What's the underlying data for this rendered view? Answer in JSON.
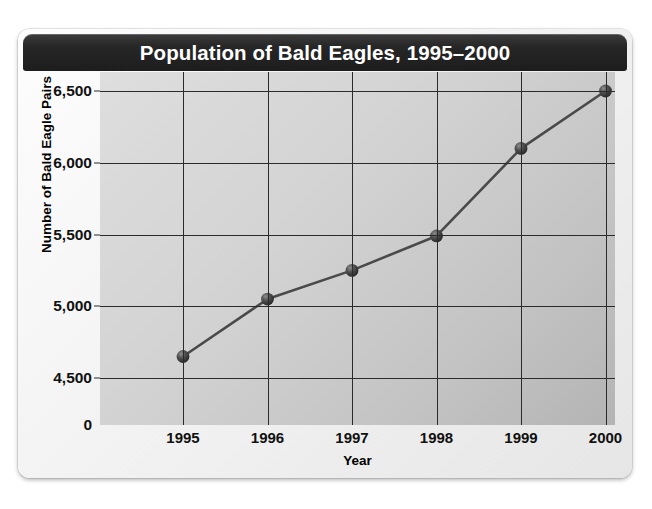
{
  "chart_data": {
    "type": "line",
    "title": "Population of Bald Eagles, 1995–2000",
    "xlabel": "Year",
    "ylabel": "Number of Bald Eagle Pairs",
    "categories": [
      "1995",
      "1996",
      "1997",
      "1998",
      "1999",
      "2000"
    ],
    "values": [
      4650,
      5050,
      5250,
      5490,
      6100,
      6500
    ],
    "y_tick_labels": [
      "6,500",
      "6,000",
      "5,500",
      "5,000",
      "4,500",
      "0"
    ],
    "y_tick_values": [
      6500,
      6000,
      5500,
      5000,
      4500,
      0
    ],
    "ylim": [
      4300,
      6600
    ],
    "axis_break": true,
    "grid": true,
    "legend": "none",
    "series": [
      {
        "name": "Bald eagle pairs",
        "values": [
          4650,
          5050,
          5250,
          5490,
          6100,
          6500
        ]
      }
    ],
    "colors": {
      "title_bar": "#242424",
      "title_text": "#ffffff",
      "plot_background_light": "#dedede",
      "plot_background_dark": "#b4b4b4",
      "grid_line": "#2b2b2b",
      "series_line": "#4a4a4a",
      "marker": "#3a3a3a",
      "card_background": "#f2f2f2"
    }
  }
}
